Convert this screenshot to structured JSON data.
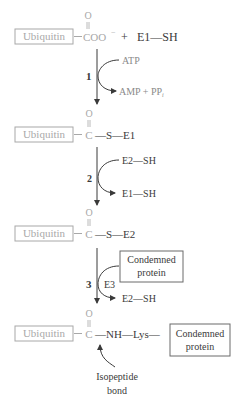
{
  "diagram": {
    "colors": {
      "ubiquitin": "#a8a8a8",
      "reaction": "#3a3a3a",
      "cofactor": "#8a8a8a",
      "box_stroke": "#a8a8a8",
      "protein_box_stroke": "#6a6a6a"
    },
    "rows": [
      {
        "ubiquitin_label": "Ubiquitin",
        "carbonyl_o": "O",
        "group": "COO",
        "charge": "−",
        "plus": "+",
        "partner": "E1—SH"
      },
      {
        "ubiquitin_label": "Ubiquitin",
        "carbonyl_o": "O",
        "carbon": "C",
        "linkage": "—S—E1"
      },
      {
        "ubiquitin_label": "Ubiquitin",
        "carbonyl_o": "O",
        "carbon": "C",
        "linkage": "—S—E2"
      },
      {
        "ubiquitin_label": "Ubiquitin",
        "carbonyl_o": "O",
        "carbon": "C",
        "linkage": "—NH—Lys—",
        "protein_line1": "Condemned",
        "protein_line2": "protein"
      }
    ],
    "steps": [
      {
        "number": "1",
        "input": "ATP",
        "output_main": "AMP + PP",
        "output_sub": "i"
      },
      {
        "number": "2",
        "input": "E2—SH",
        "output": "E1—SH"
      },
      {
        "number": "3",
        "input_line1": "Condemned",
        "input_line2": "protein",
        "enzyme": "E3",
        "output": "E2—SH"
      }
    ],
    "annotation": {
      "line1": "Isopeptide",
      "line2": "bond"
    }
  }
}
